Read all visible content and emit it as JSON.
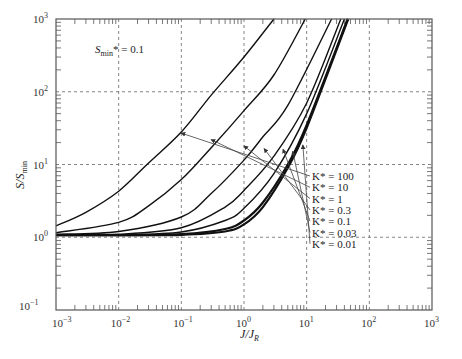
{
  "chart_data": {
    "type": "line",
    "title": "",
    "annotation": {
      "text_main": "S",
      "text_sub": "min",
      "text_rest": "* = 0.1"
    },
    "xlabel": {
      "main": "J/J",
      "sub": "R"
    },
    "ylabel": {
      "main": "S/S",
      "sub": "min"
    },
    "xscale": "log",
    "yscale": "log",
    "xlim": [
      0.001,
      1000
    ],
    "ylim": [
      0.1,
      1000
    ],
    "grid": true,
    "x_ticks": [
      {
        "base": "10",
        "exp": "-3"
      },
      {
        "base": "10",
        "exp": "-2"
      },
      {
        "base": "10",
        "exp": "-1"
      },
      {
        "base": "10",
        "exp": "0"
      },
      {
        "base": "10",
        "exp": "1"
      },
      {
        "base": "10",
        "exp": "2"
      },
      {
        "base": "10",
        "exp": "3"
      }
    ],
    "y_ticks": [
      {
        "base": "10",
        "exp": "-1"
      },
      {
        "base": "10",
        "exp": "0"
      },
      {
        "base": "10",
        "exp": "1"
      },
      {
        "base": "10",
        "exp": "2"
      },
      {
        "base": "10",
        "exp": "3"
      }
    ],
    "series": [
      {
        "name": "K* = 100",
        "bold": false,
        "x": [
          0.001,
          0.003,
          0.01,
          0.03,
          0.1,
          0.3,
          1,
          3.0
        ],
        "y": [
          1.43,
          2.2,
          4.3,
          10.5,
          28,
          90,
          300,
          1000
        ]
      },
      {
        "name": "K* = 10",
        "bold": false,
        "x": [
          0.001,
          0.01,
          0.03,
          0.1,
          0.3,
          1,
          3,
          9.5
        ],
        "y": [
          1.15,
          1.6,
          2.7,
          6.2,
          17,
          55,
          170,
          1000
        ]
      },
      {
        "name": "K* = 1",
        "bold": false,
        "x": [
          0.001,
          0.01,
          0.1,
          0.3,
          1,
          2,
          5,
          25
        ],
        "y": [
          1.1,
          1.2,
          1.9,
          4.0,
          11.5,
          24,
          65,
          1000
        ]
      },
      {
        "name": "K* = 0.3",
        "bold": false,
        "x": [
          0.001,
          0.01,
          0.1,
          0.5,
          1,
          3,
          10,
          35
        ],
        "y": [
          1.08,
          1.1,
          1.35,
          2.6,
          4.4,
          13,
          70,
          1000
        ]
      },
      {
        "name": "K* = 0.1",
        "bold": false,
        "x": [
          0.001,
          0.01,
          0.1,
          0.5,
          1,
          3,
          10,
          40
        ],
        "y": [
          1.07,
          1.08,
          1.18,
          1.7,
          2.5,
          7.5,
          50,
          1000
        ]
      },
      {
        "name": "K* = 0.03",
        "bold": true,
        "x": [
          0.001,
          0.01,
          0.1,
          0.5,
          1,
          2,
          5,
          10,
          45
        ],
        "y": [
          1.07,
          1.07,
          1.1,
          1.3,
          1.7,
          3.0,
          10,
          35,
          1000
        ]
      },
      {
        "name": "K* = 0.01",
        "bold": true,
        "x": [
          0.001,
          0.01,
          0.1,
          0.5,
          1,
          2,
          5,
          10,
          46
        ],
        "y": [
          1.07,
          1.07,
          1.08,
          1.2,
          1.5,
          2.6,
          9,
          32,
          1000
        ]
      }
    ],
    "legend": {
      "position": "right-inside",
      "entries": [
        "K* = 100",
        "K* = 10",
        "K* = 1",
        "K* = 0.3",
        "K* = 0.1",
        "K* = 0.03",
        "K* = 0.01"
      ],
      "arrow_tips": [
        [
          0.1,
          27
        ],
        [
          0.3,
          22
        ],
        [
          1.0,
          18
        ],
        [
          2.1,
          16.5
        ],
        [
          4.2,
          16.2
        ],
        [
          6.0,
          15.2
        ],
        [
          8.7,
          18.5
        ]
      ]
    }
  }
}
